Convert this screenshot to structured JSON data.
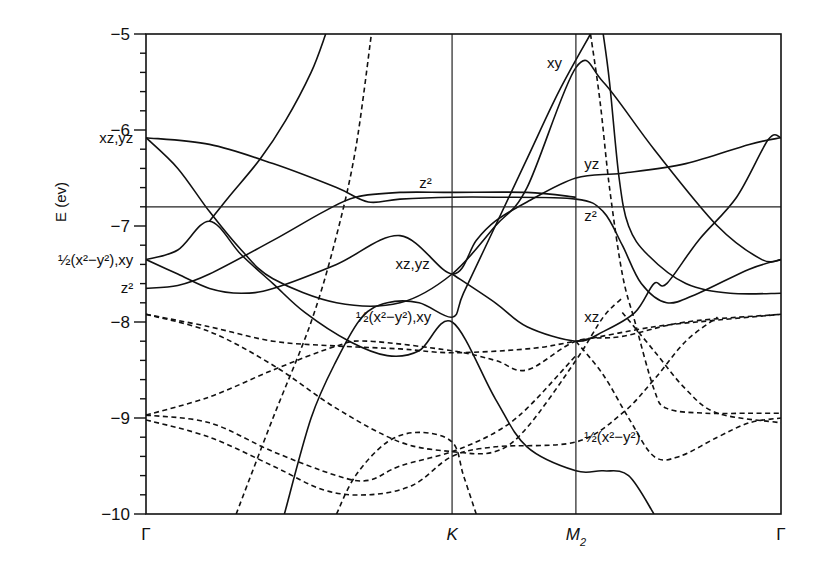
{
  "chart_data": {
    "type": "line",
    "title": "",
    "xlabel": "",
    "ylabel": "E (ev)",
    "ylim": [
      -10,
      -5
    ],
    "xlim": [
      0,
      1
    ],
    "grid": false,
    "yticks": [
      -5,
      -6,
      -7,
      -8,
      -9,
      -10
    ],
    "ytick_labels": [
      "−5",
      "−6",
      "−7",
      "−8",
      "−9",
      "−10"
    ],
    "kpoints": [
      {
        "label": "Γ",
        "sub": "",
        "x": 0.0
      },
      {
        "label": "K",
        "sub": "",
        "x": 0.482
      },
      {
        "label": "M",
        "sub": "2",
        "x": 0.677
      },
      {
        "label": "Γ",
        "sub": "",
        "x": 1.0
      }
    ],
    "reference_energy": -6.8,
    "series": [
      {
        "name": "solid-1 xz,yz Γ down",
        "style": "solid",
        "points": [
          [
            0,
            -6.08
          ],
          [
            0.05,
            -6.4
          ],
          [
            0.1,
            -6.85
          ],
          [
            0.15,
            -7.25
          ],
          [
            0.2,
            -7.55
          ],
          [
            0.3,
            -7.8
          ],
          [
            0.4,
            -7.8
          ],
          [
            0.482,
            -7.5
          ],
          [
            0.55,
            -7.0
          ],
          [
            0.6,
            -6.6
          ],
          [
            0.677,
            -5.35
          ],
          [
            0.72,
            -5.5
          ],
          [
            0.8,
            -6.2
          ],
          [
            0.9,
            -7.0
          ],
          [
            0.97,
            -7.35
          ],
          [
            1,
            -7.35
          ]
        ]
      },
      {
        "name": "solid-2 xz,yz Γ flat then z2",
        "style": "solid",
        "points": [
          [
            0,
            -6.08
          ],
          [
            0.1,
            -6.15
          ],
          [
            0.2,
            -6.35
          ],
          [
            0.3,
            -6.6
          ],
          [
            0.35,
            -6.75
          ],
          [
            0.4,
            -6.72
          ],
          [
            0.482,
            -6.7
          ],
          [
            0.55,
            -6.7
          ],
          [
            0.677,
            -6.72
          ],
          [
            0.72,
            -6.85
          ],
          [
            0.75,
            -7.2
          ],
          [
            0.78,
            -7.6
          ],
          [
            0.82,
            -7.8
          ],
          [
            0.87,
            -7.7
          ],
          [
            0.95,
            -7.45
          ],
          [
            1,
            -7.35
          ]
        ]
      },
      {
        "name": "solid-3 steep left",
        "style": "solid",
        "points": [
          [
            0.1,
            -6.95
          ],
          [
            0.13,
            -6.7
          ],
          [
            0.18,
            -6.3
          ],
          [
            0.22,
            -5.9
          ],
          [
            0.26,
            -5.4
          ],
          [
            0.283,
            -5.0
          ]
        ]
      },
      {
        "name": "solid-3b",
        "style": "solid",
        "points": [
          [
            0,
            -7.35
          ],
          [
            0.05,
            -7.25
          ],
          [
            0.1,
            -6.95
          ],
          [
            0.15,
            -7.3
          ],
          [
            0.2,
            -7.6
          ],
          [
            0.25,
            -7.9
          ],
          [
            0.32,
            -8.2
          ],
          [
            0.38,
            -8.35
          ],
          [
            0.43,
            -8.3
          ],
          [
            0.482,
            -8.0
          ],
          [
            0.55,
            -8.8
          ],
          [
            0.6,
            -9.3
          ],
          [
            0.677,
            -9.55
          ],
          [
            0.72,
            -9.55
          ],
          [
            0.76,
            -9.6
          ],
          [
            0.8,
            -10.0
          ]
        ]
      },
      {
        "name": "solid-4 z2 Γ up",
        "style": "solid",
        "points": [
          [
            0,
            -7.65
          ],
          [
            0.05,
            -7.62
          ],
          [
            0.1,
            -7.5
          ],
          [
            0.2,
            -7.15
          ],
          [
            0.28,
            -6.85
          ],
          [
            0.33,
            -6.7
          ],
          [
            0.4,
            -6.65
          ],
          [
            0.482,
            -6.65
          ],
          [
            0.6,
            -6.65
          ],
          [
            0.677,
            -6.7
          ]
        ]
      },
      {
        "name": "solid-5 xz,yz rising to yz",
        "style": "solid",
        "points": [
          [
            0,
            -7.35
          ],
          [
            0.05,
            -7.5
          ],
          [
            0.1,
            -7.65
          ],
          [
            0.15,
            -7.7
          ],
          [
            0.2,
            -7.65
          ],
          [
            0.3,
            -7.4
          ],
          [
            0.4,
            -7.1
          ],
          [
            0.482,
            -7.5
          ],
          [
            0.52,
            -7.15
          ],
          [
            0.55,
            -6.95
          ],
          [
            0.6,
            -6.75
          ],
          [
            0.677,
            -6.5
          ],
          [
            0.75,
            -6.45
          ],
          [
            0.85,
            -6.35
          ],
          [
            0.95,
            -6.15
          ],
          [
            1,
            -6.08
          ]
        ]
      },
      {
        "name": "solid-6 line from bottom",
        "style": "solid",
        "points": [
          [
            0.218,
            -10.0
          ],
          [
            0.26,
            -9.0
          ],
          [
            0.3,
            -8.4
          ],
          [
            0.34,
            -7.95
          ],
          [
            0.38,
            -7.8
          ],
          [
            0.43,
            -7.8
          ],
          [
            0.482,
            -7.95
          ],
          [
            0.5,
            -7.7
          ],
          [
            0.55,
            -7.0
          ],
          [
            0.6,
            -6.3
          ],
          [
            0.65,
            -5.6
          ],
          [
            0.7,
            -5.0
          ]
        ]
      },
      {
        "name": "solid-7 xz at M2",
        "style": "solid",
        "points": [
          [
            0.482,
            -7.5
          ],
          [
            0.55,
            -7.8
          ],
          [
            0.6,
            -8.05
          ],
          [
            0.677,
            -8.2
          ],
          [
            0.72,
            -8.1
          ],
          [
            0.77,
            -7.9
          ],
          [
            0.8,
            -7.6
          ],
          [
            0.82,
            -7.6
          ],
          [
            0.87,
            -7.15
          ],
          [
            0.93,
            -6.7
          ],
          [
            0.98,
            -6.1
          ],
          [
            1,
            -6.08
          ]
        ]
      },
      {
        "name": "solid-8 steep right",
        "style": "solid",
        "points": [
          [
            0.72,
            -5.0
          ],
          [
            0.73,
            -5.5
          ],
          [
            0.745,
            -6.5
          ],
          [
            0.76,
            -7.0
          ],
          [
            0.79,
            -7.3
          ],
          [
            0.85,
            -7.6
          ],
          [
            0.92,
            -7.7
          ],
          [
            1,
            -7.7
          ]
        ]
      },
      {
        "name": "dashed-1 top left steep",
        "style": "dashed",
        "points": [
          [
            0.142,
            -10.0
          ],
          [
            0.2,
            -9.0
          ],
          [
            0.26,
            -8.0
          ],
          [
            0.3,
            -7.1
          ],
          [
            0.33,
            -6.2
          ],
          [
            0.355,
            -5.0
          ]
        ]
      },
      {
        "name": "dashed-2 right steep",
        "style": "dashed",
        "points": [
          [
            0.7,
            -5.0
          ],
          [
            0.715,
            -5.7
          ],
          [
            0.73,
            -6.6
          ],
          [
            0.75,
            -7.5
          ],
          [
            0.77,
            -8.0
          ],
          [
            0.8,
            -8.7
          ],
          [
            0.82,
            -8.9
          ],
          [
            0.88,
            -8.95
          ],
          [
            0.95,
            -8.95
          ],
          [
            1,
            -8.95
          ]
        ]
      },
      {
        "name": "dashed-3 Γ -7.9 down",
        "style": "dashed",
        "points": [
          [
            0,
            -7.92
          ],
          [
            0.1,
            -8.1
          ],
          [
            0.2,
            -8.45
          ],
          [
            0.3,
            -8.9
          ],
          [
            0.4,
            -9.25
          ],
          [
            0.482,
            -9.35
          ],
          [
            0.55,
            -9.35
          ],
          [
            0.6,
            -9.1
          ],
          [
            0.677,
            -8.4
          ],
          [
            0.72,
            -7.95
          ],
          [
            0.75,
            -7.75
          ]
        ]
      },
      {
        "name": "dashed-4 Γ -7.9 flat",
        "style": "dashed",
        "points": [
          [
            0,
            -7.92
          ],
          [
            0.1,
            -8.05
          ],
          [
            0.2,
            -8.2
          ],
          [
            0.3,
            -8.25
          ],
          [
            0.4,
            -8.28
          ],
          [
            0.482,
            -8.32
          ],
          [
            0.6,
            -8.28
          ],
          [
            0.677,
            -8.2
          ],
          [
            0.8,
            -8.05
          ],
          [
            0.9,
            -7.98
          ],
          [
            1,
            -7.92
          ]
        ]
      },
      {
        "name": "dashed-5 Γ -9 up",
        "style": "dashed",
        "points": [
          [
            0,
            -8.97
          ],
          [
            0.1,
            -8.78
          ],
          [
            0.2,
            -8.5
          ],
          [
            0.3,
            -8.25
          ],
          [
            0.35,
            -8.2
          ],
          [
            0.482,
            -8.3
          ],
          [
            0.55,
            -8.4
          ],
          [
            0.6,
            -8.5
          ],
          [
            0.677,
            -8.2
          ],
          [
            0.75,
            -8.15
          ],
          [
            0.85,
            -8.0
          ],
          [
            1,
            -7.92
          ]
        ]
      },
      {
        "name": "dashed-6 Γ -9 down",
        "style": "dashed",
        "points": [
          [
            0,
            -9.02
          ],
          [
            0.1,
            -9.2
          ],
          [
            0.2,
            -9.5
          ],
          [
            0.28,
            -9.75
          ],
          [
            0.35,
            -9.8
          ],
          [
            0.42,
            -9.7
          ],
          [
            0.482,
            -9.4
          ],
          [
            0.55,
            -9.3
          ],
          [
            0.677,
            -9.25
          ],
          [
            0.75,
            -8.95
          ],
          [
            0.8,
            -8.6
          ],
          [
            0.85,
            -8.2
          ],
          [
            0.9,
            -7.95
          ]
        ]
      },
      {
        "name": "dashed-7 middle hump",
        "style": "dashed",
        "points": [
          [
            0,
            -8.97
          ],
          [
            0.1,
            -9.05
          ],
          [
            0.2,
            -9.35
          ],
          [
            0.3,
            -9.6
          ],
          [
            0.35,
            -9.65
          ],
          [
            0.4,
            -9.5
          ],
          [
            0.482,
            -9.35
          ],
          [
            0.55,
            -9.15
          ],
          [
            0.6,
            -8.9
          ],
          [
            0.677,
            -8.35
          ]
        ]
      },
      {
        "name": "dashed-8 bump under K",
        "style": "dashed",
        "points": [
          [
            0.3,
            -10.0
          ],
          [
            0.33,
            -9.6
          ],
          [
            0.38,
            -9.25
          ],
          [
            0.43,
            -9.15
          ],
          [
            0.482,
            -9.25
          ],
          [
            0.5,
            -9.6
          ],
          [
            0.52,
            -10.0
          ]
        ]
      },
      {
        "name": "dashed-9 right lower",
        "style": "dashed",
        "points": [
          [
            0.677,
            -8.2
          ],
          [
            0.72,
            -8.55
          ],
          [
            0.76,
            -9.0
          ],
          [
            0.8,
            -9.4
          ],
          [
            0.84,
            -9.4
          ],
          [
            0.9,
            -9.2
          ],
          [
            0.95,
            -9.05
          ],
          [
            1,
            -9.0
          ]
        ]
      },
      {
        "name": "dashed-10 right cross",
        "style": "dashed",
        "points": [
          [
            0.75,
            -7.9
          ],
          [
            0.8,
            -8.3
          ],
          [
            0.85,
            -8.7
          ],
          [
            0.9,
            -8.95
          ],
          [
            1,
            -9.05
          ]
        ]
      }
    ],
    "annotations": [
      {
        "id": "ann-gamma-xzyz",
        "text": "xz,yz",
        "x": -0.02,
        "y": -6.08,
        "anchor": "end"
      },
      {
        "id": "ann-gamma-x2y2xy",
        "text": "½(x²−y²),xy",
        "x": -0.02,
        "y": -7.35,
        "anchor": "end"
      },
      {
        "id": "ann-gamma-z2",
        "text": "z²",
        "x": -0.02,
        "y": -7.65,
        "anchor": "end"
      },
      {
        "id": "ann-k-z2",
        "text": "z²",
        "x": 0.44,
        "y": -6.55,
        "anchor": "middle"
      },
      {
        "id": "ann-k-xzyz",
        "text": "xz,yz",
        "x": 0.42,
        "y": -7.4,
        "anchor": "middle"
      },
      {
        "id": "ann-k-x2y2xy",
        "text": "½(x²−y²),xy",
        "x": 0.39,
        "y": -7.95,
        "anchor": "middle"
      },
      {
        "id": "ann-m2-xy",
        "text": "xy",
        "x": 0.655,
        "y": -5.3,
        "anchor": "end"
      },
      {
        "id": "ann-m2-yz",
        "text": "yz",
        "x": 0.69,
        "y": -6.35,
        "anchor": "start"
      },
      {
        "id": "ann-m2-z2",
        "text": "z²",
        "x": 0.69,
        "y": -6.9,
        "anchor": "start"
      },
      {
        "id": "ann-m2-xz",
        "text": "xz",
        "x": 0.69,
        "y": -7.95,
        "anchor": "start"
      },
      {
        "id": "ann-m2-x2y2",
        "text": "½(x²−y²)",
        "x": 0.69,
        "y": -9.2,
        "anchor": "start"
      }
    ]
  }
}
